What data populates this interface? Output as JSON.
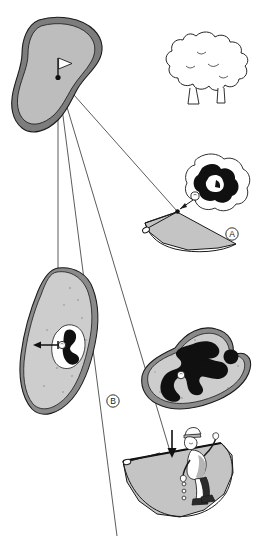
{
  "figure": {
    "background_color": "#ffffff",
    "width": 259,
    "height": 536,
    "palette": {
      "outline": "#1a1a1a",
      "green_fill": "#bdbdbd",
      "green_rim": "#7d7d7d",
      "fan_fill": "#c4c4c4",
      "sand_fill": "#cdcdcd",
      "sand_rim": "#8a8a8a",
      "hazard_black": "#101010",
      "ball_white": "#ffffff",
      "line_gray": "#4a4a4a",
      "golfer_shade": "#b5b5b5",
      "shoe_dark": "#2b2b2b"
    },
    "labels": [
      {
        "id": "label-a",
        "text": "A",
        "x": 232,
        "y": 237
      },
      {
        "id": "label-b",
        "text": "B",
        "x": 113,
        "y": 404
      }
    ],
    "elements": {
      "putting_green": {
        "name": "putting-green-top",
        "has_flagstick": true,
        "flag_color": "#ffffff",
        "pin_point": {
          "x": 58,
          "y": 77
        }
      },
      "tree": {
        "name": "tree",
        "leaf_clusters": 14,
        "trunk_count": 2
      },
      "fan_a": {
        "name": "relief-fan-a",
        "club_shown": true,
        "inset": "ball-in-rough-inset"
      },
      "fan_c": {
        "name": "relief-fan-golfer",
        "golfer_shown": true,
        "club_shown": true,
        "dropping_balls": 3
      },
      "bunker_b": {
        "name": "bunker-green-b",
        "arrow_direction": "left",
        "ball_shown": true
      },
      "hazard_green": {
        "name": "hazard-green-right",
        "ball_shown": true
      },
      "sight_lines": {
        "name": "sight-lines",
        "count": 4,
        "origin": {
          "x": 58,
          "y": 77
        }
      }
    }
  }
}
